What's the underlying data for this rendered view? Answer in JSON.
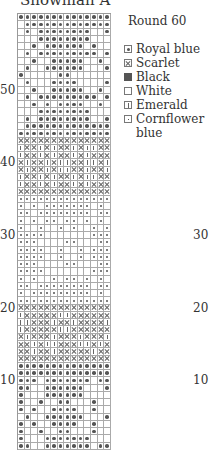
{
  "title": "Snowman A",
  "round_label": "Round 60",
  "legend": [
    {
      "code": "B",
      "label": "Royal blue"
    },
    {
      "code": "S",
      "label": "Scarlet"
    },
    {
      "code": "K",
      "label": "Black"
    },
    {
      "code": "W",
      "label": "White"
    },
    {
      "code": "E",
      "label": "Emerald"
    },
    {
      "code": "C",
      "label": "Cornflower blue"
    }
  ],
  "row_labels_left": [
    {
      "label": "50",
      "row": 50
    },
    {
      "label": "40",
      "row": 40
    },
    {
      "label": "30",
      "row": 30
    },
    {
      "label": "20",
      "row": 20
    },
    {
      "label": "10",
      "row": 10
    }
  ],
  "row_labels_right": [
    {
      "label": "30",
      "row": 30
    },
    {
      "label": "20",
      "row": 20
    },
    {
      "label": "10",
      "row": 10
    }
  ],
  "footer_text": "Round 1",
  "grid": {
    "columns": 14,
    "rows_top_to_bottom": [
      "BBBBBBBBBBBBBB",
      "WBBBBBBBBBBBBB",
      "WBWBBBBBBBBWWB",
      "WWWBBBBBBBBWWW",
      "WWBWBBBBBBWBWW",
      "WBWBBBBBBBBBWB",
      "WWBWWBBBBBWWBW",
      "WBWWBBBBBBWWWB",
      "BWWWWWBBWWWWWW",
      "WBWWWBBBBWWWWB",
      "WWBWWBBBBBWWBW",
      "WBWBBBBBBBBBWB",
      "WWBWBWBBBBWWBW",
      "WWWBBBBBBBBWWW",
      "WBWBBBBBBBBWWB",
      "WBBBBBBBBBBBBB",
      "BBBBBBBBBBBBBB",
      "SSSSSSSSSSSSSS",
      "ESSESESSESEESS",
      "ESSESESSESESSS",
      "SESSESEESSEESE",
      "SESSESEESSESSE",
      "ESSESESSESEESS",
      "ESSESESSESESSS",
      "SSSSSSSSSSSSSS",
      "CCCCCCCCCCCCCC",
      "CWCWCCCCCCCWCW",
      "CCWCCCCCCCCWCC",
      "CWCWCCWCCWCWCW",
      "CWWCWWCWCWWCWC",
      "CCCCWWWWWWWCCC",
      "CCCWWWWCCWWWCC",
      "CCCCWWCWWCWCCC",
      "CCCCWWCWWCWCCC",
      "CCCWWWWCCWWWCC",
      "CCCCWWWWWWWCCC",
      "CWCWWCWCCWCWCW",
      "CCWCCCCCCCCWCC",
      "CWCCCCCCCCCWCW",
      "CCCCCCCCCCCCCC",
      "SSSSSSSSSSSSSS",
      "ESSSSSEESSSSSS",
      "EESSSESSESSSSE",
      "ESSSSSEESSSSSS",
      "SESSSESSSESSSE",
      "SSESEESSSEESES",
      "SSESSESSSSSESS",
      "SSSSSSSSSSSSSS",
      "BBBBBBBBBBBBBB",
      "BBBBBBBBBBBBBB",
      "BBBWBBBBBBBWBB",
      "BBWWBBBBBBWWWB",
      "BWWWBBBBBBWWWW",
      "BWWBWWBBWWWBWW",
      "BWBWWBBBBWWBWW",
      "WBWWBBBBBBWWWB",
      "BWBWWBBBBWWBWW",
      "BWWBWWBBWWWBWW",
      "BWWWBBBBBBBWWW",
      "BBWWBBBBBBBWBB"
    ]
  }
}
